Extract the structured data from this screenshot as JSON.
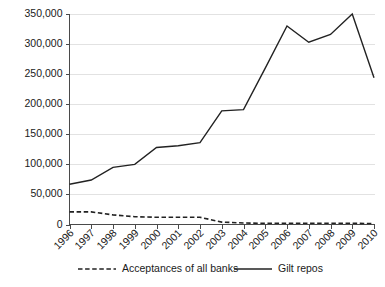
{
  "chart_data": {
    "type": "line",
    "title": "",
    "xlabel": "",
    "ylabel": "",
    "categories": [
      "1996",
      "1997",
      "1998",
      "1999",
      "2000",
      "2001",
      "2002",
      "2003",
      "2004",
      "2005",
      "2006",
      "2007",
      "2008",
      "2009",
      "2010"
    ],
    "ylim": [
      0,
      350000
    ],
    "yticks": [
      0,
      50000,
      100000,
      150000,
      200000,
      250000,
      300000,
      350000
    ],
    "ytick_labels": [
      "0",
      "50,000",
      "100,000",
      "150,000",
      "200,000",
      "250,000",
      "300,000",
      "350,000"
    ],
    "grid": true,
    "legend_position": "bottom",
    "series": [
      {
        "name": "Acceptances of all banks",
        "style": "dashed",
        "color": "#222222",
        "values": [
          21000,
          21000,
          16000,
          13000,
          12000,
          12000,
          12000,
          4000,
          2500,
          2000,
          2000,
          2000,
          2000,
          2000,
          1500
        ]
      },
      {
        "name": "Gilt repos",
        "style": "solid",
        "color": "#222222",
        "values": [
          67000,
          74000,
          95000,
          100000,
          128000,
          131000,
          136000,
          189000,
          191000,
          260000,
          330000,
          303000,
          316000,
          350000,
          244000
        ]
      }
    ]
  },
  "legend": {
    "items": [
      {
        "label": "Acceptances of all banks",
        "style": "dashed"
      },
      {
        "label": "Gilt repos",
        "style": "solid"
      }
    ]
  },
  "axes": {
    "y_tick_labels": [
      "350,000",
      "300,000",
      "250,000",
      "200,000",
      "150,000",
      "100,000",
      "50,000",
      "0"
    ],
    "x_tick_labels": [
      "1996",
      "1997",
      "1998",
      "1999",
      "2000",
      "2001",
      "2002",
      "2003",
      "2004",
      "2005",
      "2006",
      "2007",
      "2008",
      "2009",
      "2010"
    ]
  }
}
